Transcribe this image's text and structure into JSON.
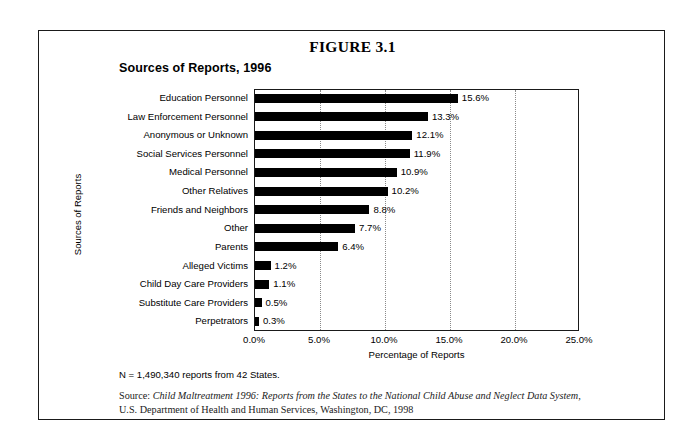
{
  "figure": {
    "title": "FIGURE 3.1",
    "subtitle": "Sources of Reports, 1996",
    "sample_note": "N = 1,490,340 reports from 42 States.",
    "source_prefix": "Source: ",
    "source_title_italic": "Child Maltreatment 1996: Reports from the States to the National Child Abuse and Neglect Data System,",
    "source_rest": "U.S. Department of Health and Human Services, Washington, DC, 1998"
  },
  "chart_data": {
    "type": "bar",
    "orientation": "horizontal",
    "title": "Sources of Reports, 1996",
    "xlabel": "Percentage of Reports",
    "ylabel": "Sources of Reports",
    "xlim": [
      0,
      25
    ],
    "xticks": [
      "0.0%",
      "5.0%",
      "10.0%",
      "15.0%",
      "20.0%",
      "25.0%"
    ],
    "xtick_values": [
      0,
      5,
      10,
      15,
      20,
      25
    ],
    "grid": "vertical-dotted",
    "legend": "none",
    "bar_color": "#000000",
    "categories": [
      "Education Personnel",
      "Law Enforcement Personnel",
      "Anonymous or Unknown",
      "Social Services Personnel",
      "Medical Personnel",
      "Other Relatives",
      "Friends and Neighbors",
      "Other",
      "Parents",
      "Alleged Victims",
      "Child Day Care Providers",
      "Substitute Care Providers",
      "Perpetrators"
    ],
    "values": [
      15.6,
      13.3,
      12.1,
      11.9,
      10.9,
      10.2,
      8.8,
      7.7,
      6.4,
      1.2,
      1.1,
      0.5,
      0.3
    ],
    "value_labels": [
      "15.6%",
      "13.3%",
      "12.1%",
      "11.9%",
      "10.9%",
      "10.2%",
      "8.8%",
      "7.7%",
      "6.4%",
      "1.2%",
      "1.1%",
      "0.5%",
      "0.3%"
    ]
  }
}
